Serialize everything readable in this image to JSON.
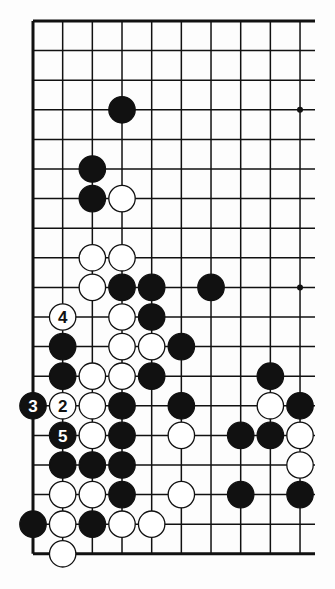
{
  "board": {
    "description": "Go problem diagram (partial board, left side)",
    "columns_shown": 10,
    "rows_shown": 19,
    "edges": {
      "top": true,
      "left": true,
      "bottom": true,
      "right": false
    },
    "origin": {
      "x": 33,
      "y": 21
    },
    "spacing": {
      "x": 29.67,
      "y": 29.6
    },
    "open_right_extent": 315,
    "stone_radius": 13.2,
    "star_points": [
      [
        9,
        3
      ],
      [
        9,
        9
      ]
    ],
    "colors": {
      "line": "#111111",
      "black": "#111111",
      "white": "#ffffff",
      "background": "#fdfdfd"
    }
  },
  "stones": [
    {
      "color": "black",
      "col": 3,
      "row": 3
    },
    {
      "color": "black",
      "col": 2,
      "row": 5
    },
    {
      "color": "black",
      "col": 2,
      "row": 6
    },
    {
      "color": "white",
      "col": 3,
      "row": 6
    },
    {
      "color": "white",
      "col": 2,
      "row": 8
    },
    {
      "color": "white",
      "col": 3,
      "row": 8
    },
    {
      "color": "white",
      "col": 2,
      "row": 9
    },
    {
      "color": "black",
      "col": 3,
      "row": 9
    },
    {
      "color": "black",
      "col": 4,
      "row": 9
    },
    {
      "color": "black",
      "col": 6,
      "row": 9
    },
    {
      "color": "white",
      "col": 1,
      "row": 10,
      "label": "4"
    },
    {
      "color": "white",
      "col": 3,
      "row": 10
    },
    {
      "color": "black",
      "col": 4,
      "row": 10
    },
    {
      "color": "black",
      "col": 1,
      "row": 11
    },
    {
      "color": "white",
      "col": 3,
      "row": 11
    },
    {
      "color": "white",
      "col": 4,
      "row": 11
    },
    {
      "color": "black",
      "col": 5,
      "row": 11
    },
    {
      "color": "black",
      "col": 1,
      "row": 12
    },
    {
      "color": "white",
      "col": 2,
      "row": 12
    },
    {
      "color": "white",
      "col": 3,
      "row": 12
    },
    {
      "color": "black",
      "col": 4,
      "row": 12
    },
    {
      "color": "black",
      "col": 8,
      "row": 12
    },
    {
      "color": "black",
      "col": 0,
      "row": 13,
      "label": "3"
    },
    {
      "color": "white",
      "col": 1,
      "row": 13,
      "label": "2"
    },
    {
      "color": "white",
      "col": 2,
      "row": 13
    },
    {
      "color": "black",
      "col": 3,
      "row": 13
    },
    {
      "color": "black",
      "col": 5,
      "row": 13
    },
    {
      "color": "white",
      "col": 8,
      "row": 13
    },
    {
      "color": "black",
      "col": 9,
      "row": 13
    },
    {
      "color": "black",
      "col": 1,
      "row": 14,
      "label": "5"
    },
    {
      "color": "white",
      "col": 2,
      "row": 14
    },
    {
      "color": "black",
      "col": 3,
      "row": 14
    },
    {
      "color": "white",
      "col": 5,
      "row": 14
    },
    {
      "color": "black",
      "col": 7,
      "row": 14
    },
    {
      "color": "black",
      "col": 8,
      "row": 14
    },
    {
      "color": "white",
      "col": 9,
      "row": 14
    },
    {
      "color": "black",
      "col": 1,
      "row": 15
    },
    {
      "color": "black",
      "col": 2,
      "row": 15
    },
    {
      "color": "black",
      "col": 3,
      "row": 15
    },
    {
      "color": "white",
      "col": 9,
      "row": 15
    },
    {
      "color": "white",
      "col": 1,
      "row": 16
    },
    {
      "color": "white",
      "col": 2,
      "row": 16
    },
    {
      "color": "black",
      "col": 3,
      "row": 16
    },
    {
      "color": "white",
      "col": 5,
      "row": 16
    },
    {
      "color": "black",
      "col": 7,
      "row": 16
    },
    {
      "color": "black",
      "col": 9,
      "row": 16
    },
    {
      "color": "black",
      "col": 0,
      "row": 17
    },
    {
      "color": "white",
      "col": 1,
      "row": 17
    },
    {
      "color": "black",
      "col": 2,
      "row": 17
    },
    {
      "color": "white",
      "col": 3,
      "row": 17
    },
    {
      "color": "white",
      "col": 4,
      "row": 17
    },
    {
      "color": "white",
      "col": 1,
      "row": 18
    }
  ]
}
